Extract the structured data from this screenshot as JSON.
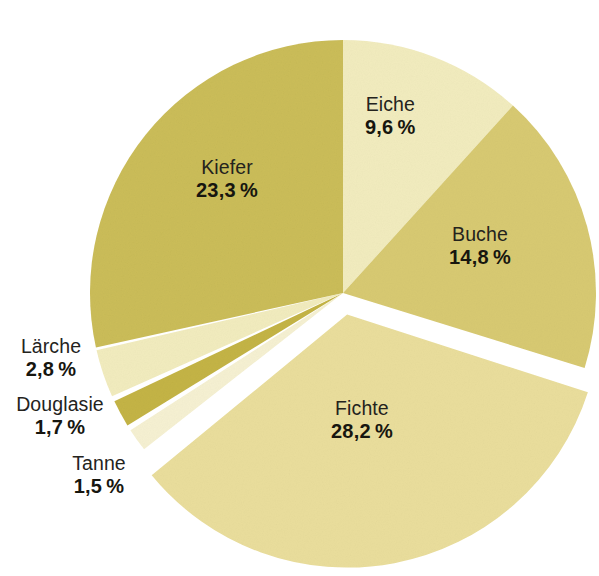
{
  "chart_data": {
    "type": "pie",
    "title": "",
    "subtitle": "",
    "xlabel": "",
    "ylabel": "",
    "legend_position": "none",
    "grid": false,
    "value_unit": "%",
    "decimal_separator": ",",
    "total": 100,
    "start_angle_deg": 0,
    "direction": "clockwise",
    "categories": [
      "Eiche",
      "Buche",
      "Fichte",
      "Tanne",
      "Douglasie",
      "Lärche",
      "Kiefer"
    ],
    "values": [
      9.6,
      14.8,
      28.2,
      1.5,
      1.7,
      2.8,
      23.3
    ],
    "slices": [
      {
        "name": "Eiche",
        "value": 9.6,
        "label": "Eiche",
        "value_label": "9,6 %",
        "color": "#f2ecbe",
        "exploded": false,
        "label_placement": "inside"
      },
      {
        "name": "Buche",
        "value": 14.8,
        "label": "Buche",
        "value_label": "14,8 %",
        "color": "#d8ca72",
        "exploded": false,
        "label_placement": "inside"
      },
      {
        "name": "Fichte",
        "value": 28.2,
        "label": "Fichte",
        "value_label": "28,2 %",
        "color": "#eade9c",
        "exploded": true,
        "label_placement": "inside"
      },
      {
        "name": "Tanne",
        "value": 1.5,
        "label": "Tanne",
        "value_label": "1,5 %",
        "color": "#f6f1d2",
        "exploded": false,
        "label_placement": "outside-left"
      },
      {
        "name": "Douglasie",
        "value": 1.7,
        "label": "Douglasie",
        "value_label": "1,7 %",
        "color": "#c4b445",
        "exploded": false,
        "label_placement": "outside-left"
      },
      {
        "name": "Lärche",
        "value": 2.8,
        "label": "Lärche",
        "value_label": "2,8 %",
        "color": "#f2ecbe",
        "exploded": false,
        "label_placement": "outside-left"
      },
      {
        "name": "Kiefer",
        "value": 23.3,
        "label": "Kiefer",
        "value_label": "23,3 %",
        "color": "#cbbd59",
        "exploded": false,
        "label_placement": "inside"
      }
    ]
  },
  "colors": {
    "background": "#ffffff",
    "text": "#1a1a17",
    "slice_light_cream": "#f2ecbe",
    "slice_pale": "#f6f1d2",
    "slice_medium_cream": "#eade9c",
    "slice_gold": "#d8ca72",
    "slice_gold_dark": "#cbbd59",
    "slice_darkest_gold": "#c4b445"
  }
}
